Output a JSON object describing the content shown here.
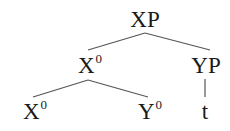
{
  "diagram": {
    "type": "syntax-tree",
    "nodes": {
      "root": {
        "label": "XP",
        "sup": ""
      },
      "left_mid": {
        "label": "X",
        "sup": "0"
      },
      "right_mid": {
        "label": "YP",
        "sup": ""
      },
      "left_leaf": {
        "label": "X",
        "sup": "0"
      },
      "mid_leaf": {
        "label": "Y",
        "sup": "0"
      },
      "trace": {
        "label": "t",
        "sup": ""
      }
    },
    "edges": [
      [
        "root",
        "left_mid"
      ],
      [
        "root",
        "right_mid"
      ],
      [
        "left_mid",
        "left_leaf"
      ],
      [
        "left_mid",
        "mid_leaf"
      ],
      [
        "right_mid",
        "trace"
      ]
    ],
    "colors": {
      "line": "#555555",
      "text": "#1a1a1a",
      "background": "#ffffff"
    }
  }
}
